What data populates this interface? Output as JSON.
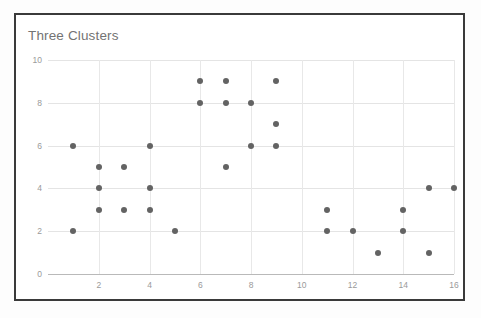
{
  "chart_data": {
    "type": "scatter",
    "title": "Three Clusters",
    "xlabel": "",
    "ylabel": "",
    "xlim": [
      0,
      16
    ],
    "ylim": [
      0,
      10
    ],
    "grid": true,
    "legend": "none",
    "x_ticks": [
      2,
      4,
      6,
      8,
      10,
      12,
      14,
      16
    ],
    "y_ticks": [
      0,
      2,
      4,
      6,
      8,
      10
    ],
    "marker_color": "#636363",
    "marker_size": 6,
    "points": [
      {
        "x": 1,
        "y": 6
      },
      {
        "x": 1,
        "y": 2
      },
      {
        "x": 2,
        "y": 5
      },
      {
        "x": 2,
        "y": 4
      },
      {
        "x": 2,
        "y": 3
      },
      {
        "x": 3,
        "y": 5
      },
      {
        "x": 3,
        "y": 3
      },
      {
        "x": 4,
        "y": 6
      },
      {
        "x": 4,
        "y": 4
      },
      {
        "x": 4,
        "y": 3
      },
      {
        "x": 5,
        "y": 2
      },
      {
        "x": 6,
        "y": 9
      },
      {
        "x": 6,
        "y": 8
      },
      {
        "x": 7,
        "y": 9
      },
      {
        "x": 7,
        "y": 8
      },
      {
        "x": 7,
        "y": 5
      },
      {
        "x": 8,
        "y": 8
      },
      {
        "x": 8,
        "y": 6
      },
      {
        "x": 9,
        "y": 9
      },
      {
        "x": 9,
        "y": 7
      },
      {
        "x": 9,
        "y": 6
      },
      {
        "x": 11,
        "y": 3
      },
      {
        "x": 11,
        "y": 2
      },
      {
        "x": 12,
        "y": 2
      },
      {
        "x": 13,
        "y": 1
      },
      {
        "x": 14,
        "y": 3
      },
      {
        "x": 14,
        "y": 2
      },
      {
        "x": 15,
        "y": 4
      },
      {
        "x": 15,
        "y": 1
      },
      {
        "x": 16,
        "y": 4
      }
    ]
  },
  "colors": {
    "marker": "#636363",
    "grid": "#e4e4e4",
    "axis": "#b9b9b9",
    "tick_label": "#9a9a9a",
    "title": "#737373",
    "card_border": "#3a3a3a",
    "card_background": "#ffffff"
  }
}
